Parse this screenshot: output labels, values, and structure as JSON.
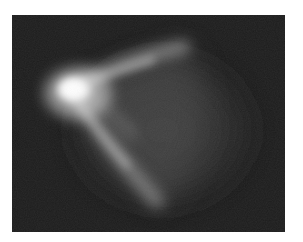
{
  "image": {
    "kind": "grayscale-photograph",
    "subject": "luminous plume with bright core and two curved arms",
    "frame": {
      "x": 12,
      "y": 15,
      "width": 273,
      "height": 217
    },
    "colors": {
      "page_background": "#ffffff",
      "frame_background": "#1c1c1c",
      "core": "#ffffff",
      "arm": "#bdbdbd",
      "halo": "#3a3a3a"
    },
    "features": {
      "core": {
        "cx": 63,
        "cy": 75,
        "rx": 22,
        "ry": 16
      },
      "upper_arm": {
        "from": [
          63,
          75
        ],
        "to": [
          170,
          32
        ]
      },
      "lower_arm": {
        "from": [
          63,
          80
        ],
        "to": [
          145,
          185
        ]
      },
      "halo": {
        "cx": 150,
        "cy": 115,
        "rx": 100,
        "ry": 85
      }
    }
  }
}
